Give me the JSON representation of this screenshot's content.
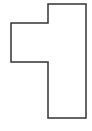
{
  "diagram": {
    "type": "polygon-outline",
    "canvas": {
      "width": 92,
      "height": 131,
      "background": "#ffffff"
    },
    "shape": {
      "points": "48,4 86,4 86,118 48,118 48,62 11,62 11,23 48,23",
      "stroke": "#333333",
      "stroke_width": 1.5,
      "fill": "none"
    }
  }
}
